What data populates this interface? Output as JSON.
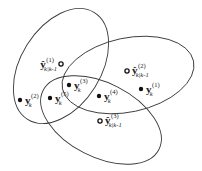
{
  "diagram": {
    "type": "gating-ellipses",
    "colors": {
      "stroke": "#3a3a3a",
      "point": "#111111",
      "background": "#ffffff"
    },
    "ellipses": [
      {
        "id": "gate-1",
        "cx": 61,
        "cy": 66,
        "rx": 63,
        "ry": 40,
        "rotate": -58
      },
      {
        "id": "gate-2",
        "cx": 128,
        "cy": 75,
        "rx": 67,
        "ry": 37,
        "rotate": -12
      },
      {
        "id": "gate-3",
        "cx": 101,
        "cy": 120,
        "rx": 65,
        "ry": 37,
        "rotate": 27
      }
    ],
    "predictions": [
      {
        "id": "pred-1",
        "x": 61,
        "y": 64,
        "main": "ŷ",
        "sup": "(1)",
        "sub": "k|k-1",
        "lx": 39,
        "ly": 68,
        "side": "left"
      },
      {
        "id": "pred-2",
        "x": 127,
        "y": 71,
        "main": "ŷ",
        "sup": "(2)",
        "sub": "k|k-1",
        "lx": 132,
        "ly": 74,
        "side": "right"
      },
      {
        "id": "pred-3",
        "x": 100,
        "y": 121,
        "main": "ŷ",
        "sup": "(3)",
        "sub": "k|k-1",
        "lx": 105,
        "ly": 124,
        "side": "right"
      }
    ],
    "measurements": [
      {
        "id": "meas-1",
        "x": 141,
        "y": 89,
        "main": "y",
        "sup": "(1)",
        "sub": "k",
        "lx": 146,
        "ly": 93
      },
      {
        "id": "meas-2",
        "x": 20,
        "y": 100,
        "main": "y",
        "sup": "(2)",
        "sub": "k",
        "lx": 25,
        "ly": 104
      },
      {
        "id": "meas-3",
        "x": 69,
        "y": 85,
        "main": "y",
        "sup": "(3)",
        "sub": "k",
        "lx": 74,
        "ly": 89
      },
      {
        "id": "meas-4",
        "x": 99,
        "y": 96,
        "main": "y",
        "sup": "(4)",
        "sub": "k",
        "lx": 104,
        "ly": 100
      },
      {
        "id": "meas-5",
        "x": 50,
        "y": 98,
        "main": "y",
        "sup": "(5)",
        "sub": "k",
        "lx": 55,
        "ly": 102
      }
    ]
  }
}
